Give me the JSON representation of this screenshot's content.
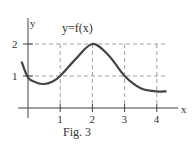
{
  "chart_data": {
    "type": "line",
    "title": "y=f(x)",
    "caption": "Fig. 3",
    "xlabel": "x",
    "ylabel": "y",
    "xlim": [
      0,
      4.3
    ],
    "ylim": [
      0,
      2
    ],
    "x_ticks": [
      "1",
      "2",
      "3",
      "4"
    ],
    "y_ticks": [
      "1",
      "2"
    ],
    "grid": "dashed",
    "series": [
      {
        "name": "f(x)",
        "x": [
          -0.2,
          0,
          0.25,
          0.5,
          0.75,
          1,
          1.5,
          2,
          2.5,
          3,
          3.5,
          4,
          4.3
        ],
        "y": [
          1.45,
          0.95,
          0.8,
          0.75,
          0.82,
          1.0,
          1.55,
          2.0,
          1.65,
          1.0,
          0.62,
          0.52,
          0.52
        ]
      }
    ]
  }
}
